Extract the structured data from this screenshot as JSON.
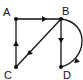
{
  "diagram": {
    "type": "directed-graph",
    "nodes": [
      {
        "id": "A",
        "label": "A",
        "x": 16,
        "y": 19
      },
      {
        "id": "B",
        "label": "B",
        "x": 61,
        "y": 19
      },
      {
        "id": "C",
        "label": "C",
        "x": 16,
        "y": 67
      },
      {
        "id": "D",
        "label": "D",
        "x": 61,
        "y": 67
      }
    ],
    "edges": [
      {
        "from": "A",
        "to": "B",
        "style": "straight"
      },
      {
        "from": "B",
        "to": "C",
        "style": "straight"
      },
      {
        "from": "C",
        "to": "A",
        "style": "straight"
      },
      {
        "from": "B",
        "to": "D",
        "style": "straight"
      },
      {
        "from": "B",
        "to": "D",
        "style": "curved"
      }
    ],
    "colors": {
      "stroke": "#111111",
      "background": "#ffffff"
    }
  }
}
